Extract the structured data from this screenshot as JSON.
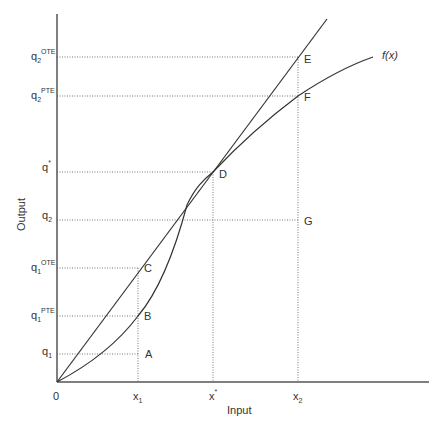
{
  "diagram": {
    "type": "production-function-efficiency",
    "axes": {
      "x_title": "Input",
      "y_title": "Output",
      "origin_label": "0"
    },
    "x_ticks": [
      {
        "id": "x1",
        "base": "x",
        "sub": "1",
        "sup": ""
      },
      {
        "id": "xstar",
        "base": "x",
        "sub": "",
        "sup": "*"
      },
      {
        "id": "x2",
        "base": "x",
        "sub": "2",
        "sup": ""
      }
    ],
    "y_ticks": [
      {
        "id": "q2_ote",
        "base": "q",
        "sub": "2",
        "sup": "OTE"
      },
      {
        "id": "q2_pte",
        "base": "q",
        "sub": "2",
        "sup": "PTE"
      },
      {
        "id": "qstar",
        "base": "q",
        "sub": "",
        "sup": "*"
      },
      {
        "id": "q2",
        "base": "q",
        "sub": "2",
        "sup": ""
      },
      {
        "id": "q1_ote",
        "base": "q",
        "sub": "1",
        "sup": "OTE"
      },
      {
        "id": "q1_pte",
        "base": "q",
        "sub": "1",
        "sup": "PTE"
      },
      {
        "id": "q1",
        "base": "q",
        "sub": "1",
        "sup": ""
      }
    ],
    "points": [
      "A",
      "B",
      "C",
      "D",
      "E",
      "F",
      "G"
    ],
    "curve_label": "f(x)",
    "colors": {
      "axis": "#555555",
      "curve": "#333333",
      "guide": "#777777",
      "text": "#333333"
    }
  }
}
